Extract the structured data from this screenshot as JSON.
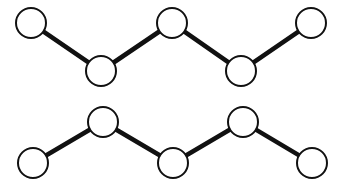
{
  "figure": {
    "background_color": "#ffffff",
    "width": 343,
    "height": 190,
    "node_fill_color": "#ffffff",
    "node_stroke_color": "#111111",
    "edge_color": "#111111",
    "node_radius": 15,
    "node_stroke_width": 2.0,
    "edge_stroke_width": 4.6
  },
  "chart_data": {
    "type": "scatter",
    "xlabel": "",
    "ylabel": "",
    "xlim": [
      0,
      343
    ],
    "ylim": [
      190,
      0
    ],
    "grid": false,
    "legend": "none",
    "series": [
      {
        "name": "top-chain",
        "phase": "starts-high",
        "node_count": 5,
        "edge_count": 4,
        "x": [
          31,
          101,
          172,
          241,
          311
        ],
        "y": [
          23,
          71,
          23,
          71,
          23
        ],
        "edges": [
          [
            0,
            1
          ],
          [
            1,
            2
          ],
          [
            2,
            3
          ],
          [
            3,
            4
          ]
        ]
      },
      {
        "name": "bottom-chain",
        "phase": "starts-low",
        "node_count": 5,
        "edge_count": 4,
        "x": [
          33,
          103,
          173,
          243,
          312
        ],
        "y": [
          163,
          122,
          163,
          122,
          163
        ],
        "edges": [
          [
            0,
            1
          ],
          [
            1,
            2
          ],
          [
            2,
            3
          ],
          [
            3,
            4
          ]
        ]
      }
    ]
  }
}
